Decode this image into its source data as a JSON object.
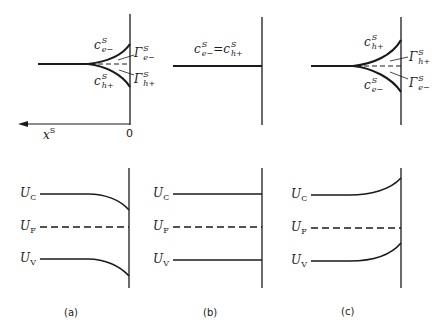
{
  "figure": {
    "panels": [
      {
        "caption": "(a)",
        "surface_labels": {
          "upper": {
            "base": "c",
            "sup": "S",
            "sub": "e−"
          },
          "lower": {
            "base": "c",
            "sup": "S",
            "sub": "h+"
          },
          "gamma_upper": {
            "base": "Γ",
            "sup": "S",
            "sub": "e−"
          },
          "gamma_lower": {
            "base": "Γ",
            "sup": "S",
            "sub": "h+"
          }
        },
        "axis": {
          "x_label_base": "x",
          "x_label_sup": "S",
          "origin": "0"
        },
        "bands": {
          "UC": "U",
          "UC_sub": "C",
          "UF": "U",
          "UF_sub": "F",
          "UV": "U",
          "UV_sub": "V"
        },
        "band_bending": "down"
      },
      {
        "caption": "(b)",
        "surface_label": {
          "left_base": "c",
          "left_sup": "S",
          "left_sub": "e−",
          "eq": "=",
          "right_base": "c",
          "right_sup": "S",
          "right_sub": "h+"
        },
        "bands": {
          "UC": "U",
          "UC_sub": "C",
          "UF": "U",
          "UF_sub": "F",
          "UV": "U",
          "UV_sub": "V"
        },
        "band_bending": "flat"
      },
      {
        "caption": "(c)",
        "surface_labels": {
          "upper": {
            "base": "c",
            "sup": "S",
            "sub": "h+"
          },
          "lower": {
            "base": "c",
            "sup": "S",
            "sub": "e−"
          },
          "gamma_upper": {
            "base": "Γ",
            "sup": "S",
            "sub": "h+"
          },
          "gamma_lower": {
            "base": "Γ",
            "sup": "S",
            "sub": "e−"
          }
        },
        "bands": {
          "UC": "U",
          "UC_sub": "C",
          "UF": "U",
          "UF_sub": "F",
          "UV": "U",
          "UV_sub": "V"
        },
        "band_bending": "up"
      }
    ]
  }
}
